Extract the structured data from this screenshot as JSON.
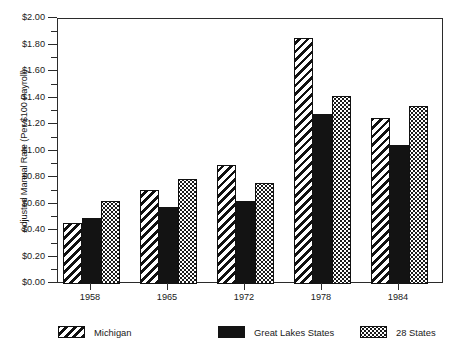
{
  "chart_data": {
    "type": "bar",
    "title": "",
    "subtitle": "",
    "xlabel": "",
    "ylabel": "Adjusted Manual Rate (Per $100 Payroll)",
    "categories": [
      "1958",
      "1965",
      "1972",
      "1978",
      "1984"
    ],
    "series": [
      {
        "name": "Michigan",
        "pattern": "diagonal-hatch",
        "values": [
          0.46,
          0.71,
          0.9,
          1.86,
          1.25
        ]
      },
      {
        "name": "Great Lakes States",
        "pattern": "solid-black",
        "values": [
          0.5,
          0.58,
          0.63,
          1.28,
          1.05
        ]
      },
      {
        "name": "28 States",
        "pattern": "dotted",
        "values": [
          0.63,
          0.79,
          0.76,
          1.42,
          1.34
        ]
      }
    ],
    "ylim": [
      0.0,
      2.0
    ],
    "ytick_step": 0.2,
    "yminor_step": 0.1,
    "ytick_labels": [
      "$2.00",
      "$1.80",
      "$1.60",
      "$1.40",
      "$1.20",
      "$1.00",
      "$0.80",
      "$0.60",
      "$0.40",
      "$0.20",
      "$0.00"
    ],
    "ytick_values": [
      2.0,
      1.8,
      1.6,
      1.4,
      1.2,
      1.0,
      0.8,
      0.6,
      0.4,
      0.2,
      0.0
    ],
    "grid": false,
    "frame": true,
    "legend_position": "bottom",
    "colors": {
      "axis": "#2b2b2b",
      "text": "#1a1a1a",
      "bar_outline": "#111111",
      "solid_fill": "#131313",
      "background": "#ffffff"
    }
  },
  "legend": {
    "items": [
      {
        "label": "Michigan"
      },
      {
        "label": "Great Lakes States"
      },
      {
        "label": "28 States"
      }
    ]
  }
}
